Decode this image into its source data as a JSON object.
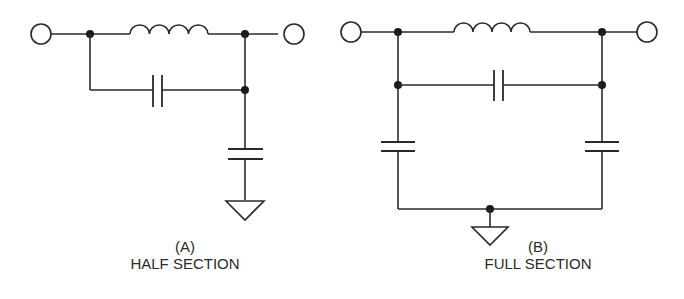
{
  "figure": {
    "diagrams": [
      {
        "id": "A",
        "caption_letter": "(A)",
        "caption_title": "HALF SECTION",
        "components": [
          "input-terminal",
          "series-inductor",
          "bridging-capacitor",
          "shunt-capacitor",
          "ground",
          "output-terminal"
        ]
      },
      {
        "id": "B",
        "caption_letter": "(B)",
        "caption_title": "FULL SECTION",
        "components": [
          "input-terminal",
          "series-inductor",
          "bridging-capacitor",
          "shunt-capacitor-left",
          "shunt-capacitor-right",
          "ground",
          "output-terminal"
        ]
      }
    ],
    "colors": {
      "line": "#2a2a2a",
      "background": "#ffffff"
    }
  }
}
